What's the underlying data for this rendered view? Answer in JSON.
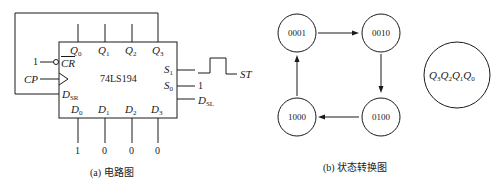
{
  "circuit": {
    "chip_name": "74LS194",
    "outputs": [
      "Q0",
      "Q1",
      "Q2",
      "Q3"
    ],
    "inputs": [
      "D0",
      "D1",
      "D2",
      "D3"
    ],
    "input_values": [
      "1",
      "0",
      "0",
      "0"
    ],
    "left_pins": {
      "clear": "CR",
      "clear_value": "1",
      "clock": "CP",
      "serial_right": "DSR"
    },
    "right_pins": {
      "s1": "S1",
      "s0": "S0",
      "s0_value": "1",
      "serial_left": "DSL",
      "start_signal": "ST"
    },
    "caption": "(a) 电路图"
  },
  "state_diagram": {
    "states": [
      "0001",
      "0010",
      "0100",
      "1000"
    ],
    "transitions": [
      [
        "0001",
        "0010"
      ],
      [
        "0010",
        "0100"
      ],
      [
        "0100",
        "1000"
      ],
      [
        "1000",
        "0001"
      ]
    ],
    "legend": "Q3Q2Q1Q0",
    "caption": "(b) 状态转换图"
  }
}
